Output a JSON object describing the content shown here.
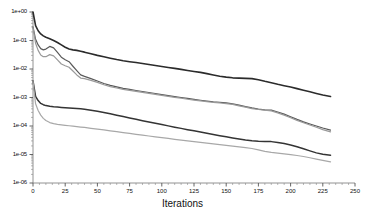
{
  "chart_data": {
    "type": "line",
    "title": "",
    "subtitle": "",
    "xlabel": "Iterations",
    "ylabel": "",
    "grid": false,
    "legend": "none",
    "yscale": "log",
    "xlim": [
      0,
      250
    ],
    "ylim": [
      1e-06,
      1
    ],
    "xticks": [
      0,
      25,
      50,
      75,
      100,
      125,
      150,
      175,
      200,
      225,
      250
    ],
    "xtick_labels": [
      "0",
      "25",
      "50",
      "75",
      "100",
      "125",
      "150",
      "175",
      "200",
      "225",
      "250"
    ],
    "yticks": [
      1,
      0.1,
      0.01,
      0.001,
      0.0001,
      1e-05,
      1e-06
    ],
    "ytick_labels": [
      "1e+00",
      "1e-01",
      "1e-02",
      "1e-03",
      "1e-04",
      "1e-05",
      "1e-06"
    ],
    "x": [
      0,
      2,
      4,
      6,
      8,
      10,
      13,
      16,
      19,
      22,
      25,
      28,
      31,
      34,
      37,
      40,
      45,
      50,
      55,
      60,
      65,
      70,
      75,
      80,
      85,
      90,
      95,
      100,
      105,
      110,
      115,
      120,
      125,
      130,
      135,
      140,
      145,
      150,
      155,
      160,
      165,
      170,
      175,
      180,
      185,
      190,
      195,
      200,
      205,
      210,
      215,
      220,
      225,
      231
    ],
    "series": [
      {
        "name": "curve-1-dark-upper",
        "color": "#2b2b2b",
        "width": 1.6,
        "values": [
          1.0,
          0.33,
          0.22,
          0.17,
          0.145,
          0.13,
          0.115,
          0.1,
          0.085,
          0.07,
          0.058,
          0.05,
          0.047,
          0.045,
          0.042,
          0.039,
          0.034,
          0.03,
          0.027,
          0.024,
          0.0215,
          0.0195,
          0.018,
          0.0168,
          0.0155,
          0.0143,
          0.0132,
          0.0122,
          0.0113,
          0.0105,
          0.0097,
          0.0089,
          0.0082,
          0.0076,
          0.0069,
          0.0062,
          0.0056,
          0.0052,
          0.0049,
          0.0048,
          0.0047,
          0.0046,
          0.0042,
          0.0037,
          0.0033,
          0.0029,
          0.0026,
          0.00235,
          0.00205,
          0.0018,
          0.00158,
          0.00139,
          0.00122,
          0.00108
        ]
      },
      {
        "name": "curve-2-mid-gray",
        "color": "#5a5a5a",
        "width": 1.2,
        "values": [
          0.3,
          0.11,
          0.07,
          0.052,
          0.047,
          0.05,
          0.062,
          0.055,
          0.038,
          0.026,
          0.021,
          0.018,
          0.0125,
          0.0088,
          0.0062,
          0.0055,
          0.0046,
          0.0038,
          0.0031,
          0.00265,
          0.00235,
          0.0021,
          0.00192,
          0.00176,
          0.00162,
          0.0015,
          0.00138,
          0.00127,
          0.00117,
          0.00108,
          0.001,
          0.00093,
          0.00086,
          0.0008,
          0.00075,
          0.00071,
          0.00068,
          0.00065,
          0.0006,
          0.00054,
          0.00048,
          0.00043,
          0.00039,
          0.00037,
          0.00036,
          0.00031,
          0.00026,
          0.00021,
          0.00017,
          0.00014,
          0.000118,
          0.0001,
          8.5e-05,
          7.2e-05
        ]
      },
      {
        "name": "curve-3-light-gray",
        "color": "#9a9a9a",
        "width": 1.2,
        "values": [
          0.29,
          0.08,
          0.045,
          0.031,
          0.027,
          0.027,
          0.032,
          0.029,
          0.021,
          0.015,
          0.013,
          0.0115,
          0.0085,
          0.0062,
          0.0048,
          0.0046,
          0.004,
          0.0034,
          0.0028,
          0.00242,
          0.00216,
          0.00194,
          0.00178,
          0.00164,
          0.00151,
          0.0014,
          0.00129,
          0.00119,
          0.0011,
          0.00101,
          0.00094,
          0.00087,
          0.00081,
          0.00076,
          0.00071,
          0.00067,
          0.00064,
          0.00061,
          0.00057,
          0.00051,
          0.00046,
          0.00041,
          0.00038,
          0.00036,
          0.00034,
          0.00029,
          0.00024,
          0.000195,
          0.000158,
          0.00013,
          0.000108,
          9e-05,
          7.5e-05,
          6.2e-05
        ]
      },
      {
        "name": "curve-4-dark-lower",
        "color": "#343434",
        "width": 1.5,
        "values": [
          0.0038,
          0.0011,
          0.00078,
          0.00062,
          0.00056,
          0.00052,
          0.00049,
          0.00047,
          0.00046,
          0.00045,
          0.00044,
          0.00043,
          0.00042,
          0.00041,
          0.0004,
          0.00039,
          0.00036,
          0.00033,
          0.0003,
          0.00027,
          0.00024,
          0.000215,
          0.000192,
          0.000172,
          0.000154,
          0.000138,
          0.000124,
          0.000112,
          0.000101,
          9.1e-05,
          8.25e-05,
          7.45e-05,
          6.75e-05,
          6.12e-05,
          5.56e-05,
          5.05e-05,
          4.59e-05,
          4.18e-05,
          3.82e-05,
          3.51e-05,
          3.25e-05,
          3.05e-05,
          2.93e-05,
          2.88e-05,
          2.83e-05,
          2.66e-05,
          2.43e-05,
          2.16e-05,
          1.86e-05,
          1.58e-05,
          1.34e-05,
          1.14e-05,
          1.02e-05,
          9.5e-06
        ]
      },
      {
        "name": "curve-5-lightest-lower",
        "color": "#a8a8a8",
        "width": 1.2,
        "values": [
          0.0037,
          0.0006,
          0.00035,
          0.00024,
          0.000185,
          0.000155,
          0.000132,
          0.000121,
          0.000114,
          0.00011,
          0.000106,
          0.000102,
          9.85e-05,
          9.52e-05,
          9.2e-05,
          8.88e-05,
          8.32e-05,
          7.8e-05,
          7.28e-05,
          6.78e-05,
          6.32e-05,
          5.89e-05,
          5.49e-05,
          5.12e-05,
          4.78e-05,
          4.46e-05,
          4.17e-05,
          3.9e-05,
          3.65e-05,
          3.42e-05,
          3.21e-05,
          3.01e-05,
          2.83e-05,
          2.66e-05,
          2.5e-05,
          2.35e-05,
          2.21e-05,
          2.08e-05,
          1.96e-05,
          1.85e-05,
          1.74e-05,
          1.62e-05,
          1.45e-05,
          1.28e-05,
          1.18e-05,
          1.12e-05,
          1.06e-05,
          9.95e-06,
          9.2e-06,
          8.5e-06,
          7.7e-06,
          6.9e-06,
          6.2e-06,
          5.5e-06
        ]
      }
    ]
  },
  "layout": {
    "plot_left": 33,
    "plot_right": 355,
    "plot_top": 12,
    "plot_bottom": 183
  }
}
